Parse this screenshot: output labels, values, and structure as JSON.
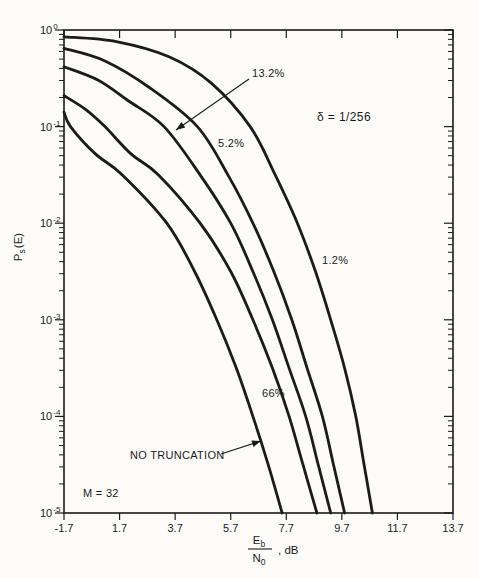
{
  "figure": {
    "background": "#fcfbf8",
    "ink": "#1b1b1b",
    "curve_stroke_width": 2.8
  },
  "chart_data": {
    "type": "line",
    "title": "",
    "xlabel": "Eb/N0, dB",
    "ylabel": "Ps(E)",
    "x_axis": {
      "tick_labels": [
        "-1.7",
        "1.7",
        "3.7",
        "5.7",
        "7.7",
        "9.7",
        "11.7",
        "13.7"
      ],
      "tick_values": [
        -1.7,
        1.7,
        3.7,
        5.7,
        7.7,
        9.7,
        11.7,
        13.7
      ],
      "range_db": [
        -1.7,
        13.7
      ]
    },
    "y_axis": {
      "scale": "log",
      "range": [
        1e-05,
        1
      ],
      "tick_exponents": [
        "0",
        "-1",
        "-2",
        "-3",
        "-4",
        "-5"
      ]
    },
    "grid": false,
    "legend": "none",
    "series": [
      {
        "name": "1.2%",
        "points_db_log10p": [
          [
            -1.7,
            -0.07
          ],
          [
            1.5,
            -0.12
          ],
          [
            3.5,
            -0.28
          ],
          [
            5.0,
            -0.55
          ],
          [
            6.4,
            -1.0
          ],
          [
            7.3,
            -1.5
          ],
          [
            8.1,
            -2.0
          ],
          [
            8.75,
            -2.5
          ],
          [
            9.3,
            -3.0
          ],
          [
            9.8,
            -3.5
          ],
          [
            10.2,
            -4.0
          ],
          [
            10.5,
            -4.5
          ],
          [
            10.8,
            -5.0
          ]
        ]
      },
      {
        "name": "5.2%",
        "points_db_log10p": [
          [
            -1.7,
            -0.19
          ],
          [
            0.8,
            -0.32
          ],
          [
            2.8,
            -0.6
          ],
          [
            4.5,
            -1.0
          ],
          [
            5.6,
            -1.5
          ],
          [
            6.5,
            -2.0
          ],
          [
            7.25,
            -2.5
          ],
          [
            7.9,
            -3.0
          ],
          [
            8.45,
            -3.5
          ],
          [
            9.0,
            -4.0
          ],
          [
            9.4,
            -4.5
          ],
          [
            9.8,
            -5.0
          ]
        ]
      },
      {
        "name": "13.2%",
        "points_db_log10p": [
          [
            -1.7,
            -0.38
          ],
          [
            0.4,
            -0.52
          ],
          [
            2.0,
            -0.73
          ],
          [
            3.3,
            -1.0
          ],
          [
            4.6,
            -1.5
          ],
          [
            5.7,
            -2.0
          ],
          [
            6.5,
            -2.5
          ],
          [
            7.2,
            -3.0
          ],
          [
            7.8,
            -3.5
          ],
          [
            8.4,
            -4.0
          ],
          [
            8.85,
            -4.5
          ],
          [
            9.3,
            -5.0
          ]
        ]
      },
      {
        "name": "66%",
        "points_db_log10p": [
          [
            -1.7,
            -0.68
          ],
          [
            -0.4,
            -0.82
          ],
          [
            0.8,
            -1.0
          ],
          [
            2.1,
            -1.28
          ],
          [
            3.1,
            -1.5
          ],
          [
            4.6,
            -2.0
          ],
          [
            5.7,
            -2.5
          ],
          [
            6.5,
            -3.0
          ],
          [
            7.2,
            -3.5
          ],
          [
            7.8,
            -4.0
          ],
          [
            8.3,
            -4.5
          ],
          [
            8.8,
            -5.0
          ]
        ]
      },
      {
        "name": "NO TRUNCATION",
        "points_db_log10p": [
          [
            -1.7,
            -0.85
          ],
          [
            -1.3,
            -1.0
          ],
          [
            0.2,
            -1.28
          ],
          [
            1.8,
            -1.5
          ],
          [
            3.4,
            -2.0
          ],
          [
            4.4,
            -2.5
          ],
          [
            5.2,
            -3.0
          ],
          [
            5.9,
            -3.5
          ],
          [
            6.5,
            -4.0
          ],
          [
            7.05,
            -4.5
          ],
          [
            7.55,
            -5.0
          ]
        ]
      }
    ],
    "annotations": [
      {
        "id": "label-13-2",
        "text": "13.2%",
        "x": 252,
        "y": 77,
        "arrow": {
          "x1": 249,
          "y1": 79,
          "x2": 176,
          "y2": 130
        }
      },
      {
        "id": "label-5-2",
        "text": "5.2%",
        "x": 218,
        "y": 147
      },
      {
        "id": "label-delta",
        "text": "δ = 1/256",
        "x": 317,
        "y": 121,
        "cls": "delta-label"
      },
      {
        "id": "label-1-2",
        "text": "1.2%",
        "x": 322,
        "y": 264
      },
      {
        "id": "label-66",
        "text": "66%",
        "x": 262,
        "y": 397
      },
      {
        "id": "label-no-truncation",
        "text": "NO TRUNCATION",
        "x": 130,
        "y": 459,
        "arrow": {
          "x1": 221,
          "y1": 454,
          "x2": 261,
          "y2": 441
        }
      },
      {
        "id": "label-m32",
        "text": "M = 32",
        "x": 83,
        "y": 497
      }
    ],
    "ylabel_parts": {
      "main": "P",
      "sub": "s",
      "rest": "(E)"
    },
    "xlabel_parts": {
      "num_main": "E",
      "num_sub": "b",
      "den_main": "N",
      "den_sub": "0",
      "suffix": ", dB"
    }
  }
}
